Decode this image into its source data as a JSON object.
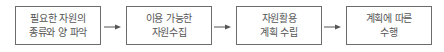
{
  "diagram": {
    "type": "process-flow",
    "direction": "left-to-right",
    "colors": {
      "border": "#6b6b6b",
      "text": "#555555",
      "arrow": "#555555",
      "background": "#ffffff"
    },
    "steps": [
      {
        "line1": "필요한 자원의",
        "line2": "종류와 양 파악"
      },
      {
        "line1": "이용 가능한",
        "line2": "자원수집"
      },
      {
        "line1": "자원활용",
        "line2": "계획 수립"
      },
      {
        "line1": "계획에 따른",
        "line2": "수행"
      }
    ],
    "arrows": [
      {
        "from": 0,
        "to": 1,
        "icon": "arrow-right-icon"
      },
      {
        "from": 1,
        "to": 2,
        "icon": "arrow-right-icon"
      },
      {
        "from": 2,
        "to": 3,
        "icon": "arrow-right-icon"
      }
    ]
  }
}
